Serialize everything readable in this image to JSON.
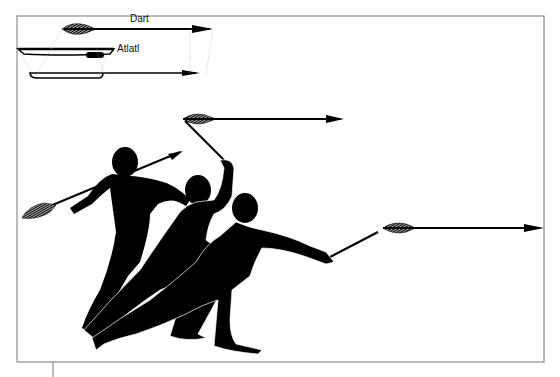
{
  "diagram": {
    "legend": {
      "dart_label": "Dart",
      "atlatl_label": "Atlatl"
    },
    "frame_color": "#777777",
    "ink_color": "#000000",
    "outline_color": "#ffffff",
    "figures": [
      {
        "name": "thrower-1",
        "pose": "dart loaded, arm drawn back"
      },
      {
        "name": "thrower-2",
        "pose": "arm raised, atlatl swinging forward"
      },
      {
        "name": "thrower-3",
        "pose": "lunging follow-through, dart released"
      }
    ],
    "darts": [
      {
        "name": "legend-dart",
        "position": "top-left key"
      },
      {
        "name": "loaded-dart",
        "position": "held by thrower 1"
      },
      {
        "name": "launch-dart",
        "position": "above thrower 2"
      },
      {
        "name": "released-dart",
        "position": "in flight, right"
      }
    ]
  }
}
